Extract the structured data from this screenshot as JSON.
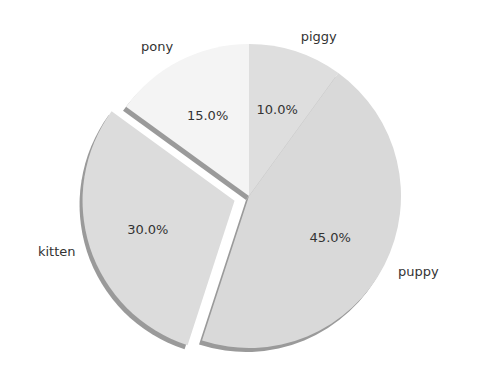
{
  "chart_data": {
    "type": "pie",
    "title": "",
    "categories": [
      "pony",
      "kitten",
      "puppy",
      "piggy"
    ],
    "values": [
      15,
      30,
      45,
      10
    ],
    "percent_labels": [
      "15.0%",
      "30.0%",
      "45.0%",
      "10.0%"
    ],
    "explode": [
      0,
      0.1,
      0,
      0
    ],
    "start_angle": 90,
    "counterclockwise": true,
    "shadow": true,
    "colors": [
      "#f4f4f4",
      "#dcdcdc",
      "#d9d9d9",
      "#dedede"
    ],
    "legend": false
  }
}
